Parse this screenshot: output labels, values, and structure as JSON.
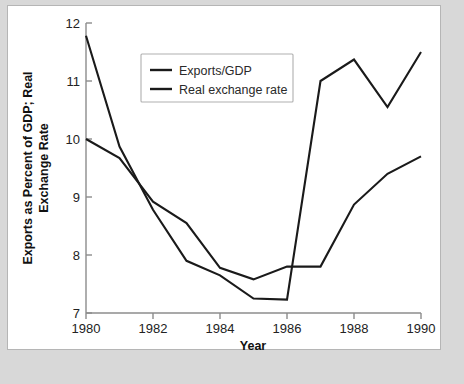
{
  "figure": {
    "background_color": "#d8d8d8",
    "panel_color": "#ffffff",
    "border_color": "#b5b5b5",
    "line_color": "#1a1a1a",
    "axis_color": "#8c8c8c"
  },
  "chart_data": {
    "type": "line",
    "title": "",
    "xlabel": "Year",
    "ylabel": "Exports as Percent of GDP; Real Exchange Rate",
    "x": [
      1980,
      1981,
      1982,
      1983,
      1984,
      1985,
      1986,
      1987,
      1988,
      1989,
      1990
    ],
    "xlim": [
      1980,
      1990
    ],
    "ylim": [
      7,
      12
    ],
    "xticks": [
      1980,
      1982,
      1984,
      1986,
      1988,
      1990
    ],
    "xtick_labels": [
      "1980",
      "1982",
      "1984",
      "1986",
      "1988",
      "1990"
    ],
    "yticks": [
      7,
      8,
      9,
      10,
      11,
      12
    ],
    "ytick_labels": [
      "7",
      "8",
      "9",
      "10",
      "11",
      "12"
    ],
    "grid": false,
    "legend_position": "upper-center-left",
    "series": [
      {
        "name": "Exports/GDP",
        "values": [
          10.0,
          9.67,
          8.92,
          8.55,
          7.78,
          7.58,
          7.8,
          7.8,
          8.87,
          9.4,
          9.7
        ]
      },
      {
        "name": "Real exchange rate",
        "values": [
          11.78,
          9.87,
          8.78,
          7.9,
          7.65,
          7.25,
          7.23,
          11.0,
          11.37,
          10.55,
          11.5
        ]
      }
    ]
  },
  "legend": {
    "entries": [
      {
        "label": "Exports/GDP"
      },
      {
        "label": "Real exchange rate"
      }
    ]
  },
  "axis": {
    "y_title_line1": "Exports as Percent of GDP; Real",
    "y_title_line2": "Exchange Rate",
    "x_title": "Year"
  }
}
